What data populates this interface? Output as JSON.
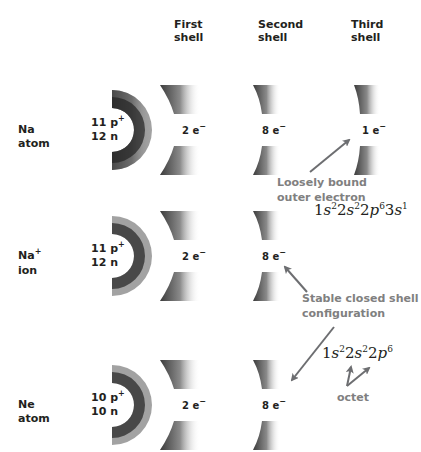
{
  "headers": {
    "first": [
      "First",
      "shell"
    ],
    "second": [
      "Second",
      "shell"
    ],
    "third": [
      "Third",
      "shell"
    ]
  },
  "rows": [
    {
      "label": [
        "Na",
        "atom"
      ],
      "nucleus": {
        "protons": "11 p",
        "protons_sup": "+",
        "neutrons": "12 n"
      },
      "shells": [
        {
          "count": "2 e",
          "sup": "−"
        },
        {
          "count": "8 e",
          "sup": "−"
        },
        {
          "count": "1 e",
          "sup": "−"
        }
      ]
    },
    {
      "label": [
        "Na",
        "ion"
      ],
      "label_sup": "+",
      "nucleus": {
        "protons": "11 p",
        "protons_sup": "+",
        "neutrons": "12 n"
      },
      "shells": [
        {
          "count": "2 e",
          "sup": "−"
        },
        {
          "count": "8 e",
          "sup": "−"
        }
      ]
    },
    {
      "label": [
        "Ne",
        "atom"
      ],
      "nucleus": {
        "protons": "10 p",
        "protons_sup": "+",
        "neutrons": "10 n"
      },
      "shells": [
        {
          "count": "2 e",
          "sup": "−"
        },
        {
          "count": "8 e",
          "sup": "−"
        }
      ]
    }
  ],
  "annotations": {
    "loosely_bound": [
      "Loosely bound",
      "outer electron"
    ],
    "stable": [
      "Stable closed shell",
      "configuration"
    ],
    "octet": "octet"
  },
  "configs": {
    "na": [
      {
        "n": "1",
        "l": "s",
        "e": "2"
      },
      {
        "n": "2",
        "l": "s",
        "e": "2"
      },
      {
        "n": "2",
        "l": "p",
        "e": "6"
      },
      {
        "n": "3",
        "l": "s",
        "e": "1"
      }
    ],
    "ne": [
      {
        "n": "1",
        "l": "s",
        "e": "2"
      },
      {
        "n": "2",
        "l": "s",
        "e": "2"
      },
      {
        "n": "2",
        "l": "p",
        "e": "6"
      }
    ]
  },
  "colors": {
    "text": "#231f20",
    "annotation": "#808080",
    "arrow": "#6d6e71",
    "shell_dark": "#3a3a3a"
  }
}
